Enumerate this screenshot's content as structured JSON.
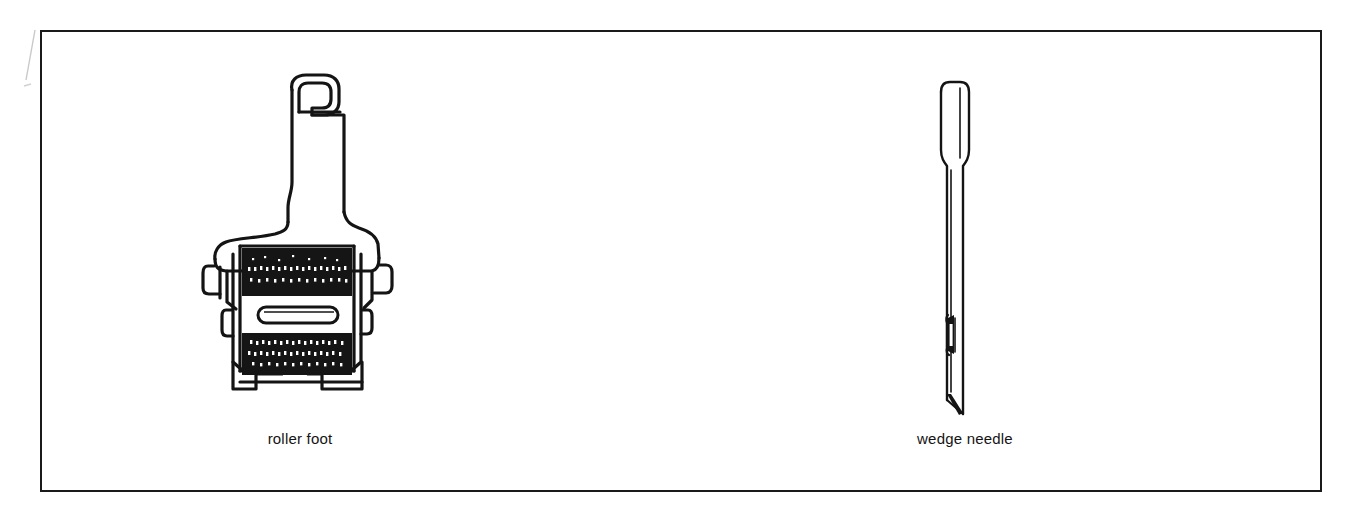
{
  "figure": {
    "background_color": "#ffffff",
    "line_color": "#1a1a1a",
    "frame": {
      "name": "figure-frame",
      "border_color": "#1a1a1a",
      "border_width_px": 2
    },
    "items": [
      {
        "id": "roller-foot",
        "caption": "roller foot",
        "icon": "roller-foot-icon",
        "description": "sewing machine roller presser foot, front view"
      },
      {
        "id": "wedge-needle",
        "caption": "wedge needle",
        "icon": "wedge-needle-icon",
        "description": "leather wedge point sewing machine needle, side view"
      }
    ]
  }
}
